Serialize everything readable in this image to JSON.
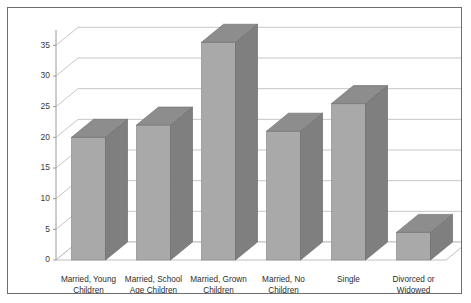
{
  "chart_data": {
    "type": "bar",
    "title": "",
    "subtitle": "",
    "xlabel": "",
    "ylabel": "",
    "ylim": [
      0,
      37.5
    ],
    "grid": true,
    "legend": false,
    "legend_position": "none",
    "three_d": true,
    "categories": [
      "Married, Young Children",
      "Married, School Age Children",
      "Married, Grown Children",
      "Married, No Children",
      "Single",
      "Divorced or Widowed"
    ],
    "category_lines": [
      [
        "Married, Young",
        "Children"
      ],
      [
        "Married, School",
        "Age Children"
      ],
      [
        "Married, Grown",
        "Children"
      ],
      [
        "Married, No",
        "Children"
      ],
      [
        "Single",
        ""
      ],
      [
        "Divorced or",
        "Widowed"
      ]
    ],
    "values": [
      20,
      22,
      35.5,
      21,
      25.5,
      4.5
    ],
    "ytick_labels": [
      "0",
      "5",
      "10",
      "15",
      "20",
      "25",
      "30",
      "35"
    ],
    "ytick_values": [
      0,
      5,
      10,
      15,
      20,
      25,
      30,
      35
    ]
  },
  "style": {
    "bar_front_color": "#a9a9a9",
    "bar_side_color": "#7f7f7f",
    "bar_top_color": "#8d8d8d",
    "gridline_color": "#b8b8b8",
    "axis_color": "#9a9a9a",
    "frame_border_color": "#6e6e6e",
    "background_color": "#ffffff",
    "label_color": "#2e2e2e"
  }
}
